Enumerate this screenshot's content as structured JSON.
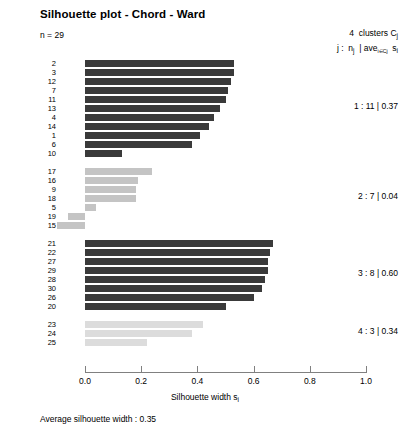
{
  "title": "Silhouette plot - Chord - Ward",
  "n_label": "n = 29",
  "legend": {
    "line1_prefix": "4",
    "line1_text": "clusters C",
    "line1_sub": "j",
    "line2_a": "j :",
    "line2_b": "n",
    "line2_b_sub": "j",
    "line2_c": "| ave",
    "line2_c_sub": "i∈Cj",
    "line2_d": "s",
    "line2_d_sub": "i"
  },
  "xaxis": {
    "title_main": "Silhouette width s",
    "title_sub": "i",
    "ticks": [
      "0.0",
      "0.2",
      "0.4",
      "0.6",
      "0.8",
      "1.0"
    ],
    "tick_values": [
      0.0,
      0.2,
      0.4,
      0.6,
      0.8,
      1.0
    ],
    "min": 0.0,
    "max": 1.0
  },
  "footer": "Average silhouette width :  0.35",
  "cluster_annotations": [
    "1 :  11  |  0.37",
    "2 :   7  |  0.04",
    "3 :   8  |  0.60",
    "4 :   3  |  0.34"
  ],
  "chart_data": {
    "type": "bar",
    "title": "Silhouette plot - Chord - Ward",
    "xlabel": "Silhouette width s_i",
    "ylabel": "",
    "xlim": [
      0.0,
      1.0
    ],
    "grid": false,
    "orientation": "horizontal",
    "n_observations": 29,
    "n_clusters": 4,
    "average_silhouette_width": 0.35,
    "clusters": [
      {
        "cluster": 1,
        "size": 11,
        "average_silhouette": 0.37,
        "color": "#3a3a3a",
        "annotation": "1 :  11  |  0.37",
        "labels": [
          "2",
          "3",
          "12",
          "7",
          "11",
          "13",
          "4",
          "14",
          "1",
          "6",
          "10"
        ],
        "values": [
          0.53,
          0.53,
          0.52,
          0.51,
          0.5,
          0.48,
          0.46,
          0.44,
          0.41,
          0.38,
          0.13
        ]
      },
      {
        "cluster": 2,
        "size": 7,
        "average_silhouette": 0.04,
        "color": "#c4c4c4",
        "annotation": "2 :   7  |  0.04",
        "labels": [
          "17",
          "16",
          "9",
          "18",
          "5",
          "19",
          "15"
        ],
        "values": [
          0.24,
          0.19,
          0.18,
          0.18,
          0.04,
          -0.06,
          -0.1
        ]
      },
      {
        "cluster": 3,
        "size": 8,
        "average_silhouette": 0.6,
        "color": "#3a3a3a",
        "annotation": "3 :   8  |  0.60",
        "labels": [
          "21",
          "22",
          "27",
          "29",
          "28",
          "30",
          "26",
          "20"
        ],
        "values": [
          0.67,
          0.66,
          0.65,
          0.65,
          0.64,
          0.63,
          0.6,
          0.5
        ]
      },
      {
        "cluster": 4,
        "size": 3,
        "average_silhouette": 0.34,
        "color": "#dcdcdc",
        "annotation": "4 :   3  |  0.34",
        "labels": [
          "23",
          "24",
          "25"
        ],
        "values": [
          0.42,
          0.38,
          0.22
        ]
      }
    ]
  }
}
